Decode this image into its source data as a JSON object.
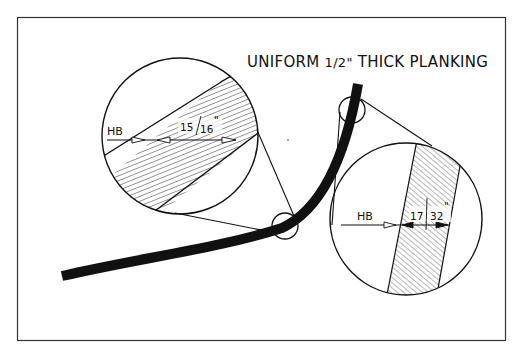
{
  "diagram": {
    "title_parts": {
      "pre": "UNIFORM ",
      "frac": "1/2\"",
      "post": " THICK PLANKING"
    },
    "colors": {
      "ink": "#111111",
      "frame": "#333333",
      "background": "#ffffff"
    },
    "plank": {
      "description": "curved hull plank section, hatched",
      "path": "M62,276 C140,258 220,248 282,228 C320,210 345,160 358,84"
    },
    "detail_left": {
      "label_hb": "HB",
      "measurement": "15/16\"",
      "measurement_num": "15",
      "measurement_den": "16",
      "measurement_mark": "\"",
      "circle": {
        "cx": 180,
        "cy": 136,
        "r": 78
      },
      "source_circle": {
        "cx": 285,
        "cy": 226,
        "r": 13
      }
    },
    "detail_right": {
      "label_hb": "HB",
      "measurement": "17/32\"",
      "measurement_num": "17",
      "measurement_den": "32",
      "measurement_mark": "\"",
      "circle": {
        "cx": 406,
        "cy": 219,
        "r": 76
      },
      "source_circle": {
        "cx": 352,
        "cy": 110,
        "r": 13
      }
    }
  }
}
